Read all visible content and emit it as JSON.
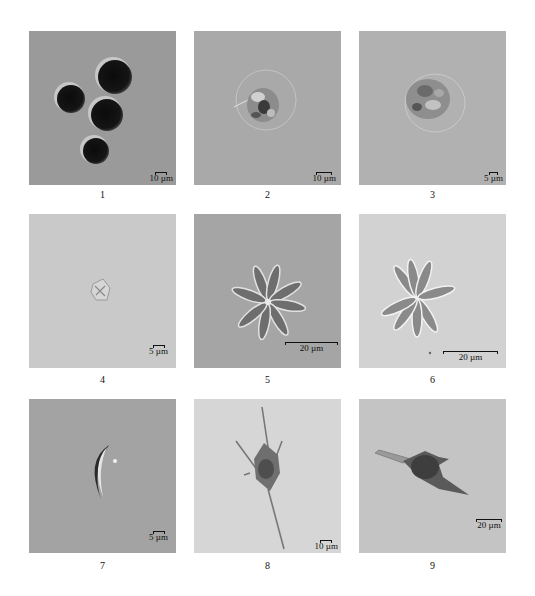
{
  "figure": {
    "panels": [
      {
        "label": "1",
        "scale": "10 µm",
        "background": "#9a9a9a",
        "subject": "four dark spherical cells"
      },
      {
        "label": "2",
        "scale": "10 µm",
        "background": "#a9a9a9",
        "subject": "single granular round cell with halo"
      },
      {
        "label": "3",
        "scale": "5 µm",
        "background": "#b1b1b1",
        "subject": "single granular ovoid cell"
      },
      {
        "label": "4",
        "scale": "5 µm",
        "background": "#c9c9c9",
        "subject": "small faint cruciform cell"
      },
      {
        "label": "5",
        "scale": "20 µm",
        "background": "#a5a5a5",
        "subject": "radiating star-shaped colony"
      },
      {
        "label": "6",
        "scale": "20 µm",
        "background": "#d2d2d2",
        "subject": "radiating star-shaped colony"
      },
      {
        "label": "7",
        "scale": "5 µm",
        "background": "#a3a3a3",
        "subject": "crescent-shaped cell"
      },
      {
        "label": "8",
        "scale": "10 µm",
        "background": "#d6d6d6",
        "subject": "spiny elongated cell"
      },
      {
        "label": "9",
        "scale": "20 µm",
        "background": "#c4c4c4",
        "subject": "horned fusiform cell"
      }
    ]
  }
}
